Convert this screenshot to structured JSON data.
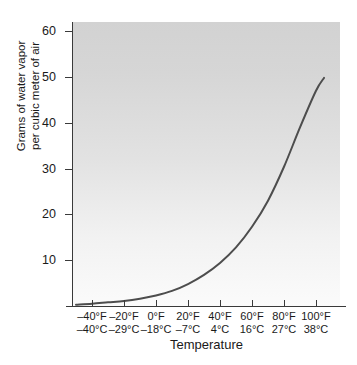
{
  "chart_data": {
    "type": "line",
    "title": "",
    "xlabel": "Temperature",
    "ylabel": "Grams of water vapor per cubic meter of air",
    "ylabel_lines": [
      "Grams of water vapor",
      "per cubic meter of air"
    ],
    "ylim": [
      0,
      63
    ],
    "yticks": [
      10,
      20,
      30,
      40,
      50,
      60
    ],
    "ytick_labels": [
      "10",
      "20",
      "30",
      "40",
      "50",
      "60"
    ],
    "xlim_f": [
      -50,
      110
    ],
    "xticks_f": [
      -40,
      -20,
      0,
      20,
      40,
      60,
      80,
      100
    ],
    "xtick_labels_f": [
      "–40°F",
      "–20°F",
      "0°F",
      "20°F",
      "40°F",
      "60°F",
      "80°F",
      "100°F"
    ],
    "xtick_labels_c": [
      "–40°C",
      "–29°C",
      "–18°C",
      "–7°C",
      "4°C",
      "16°C",
      "27°C",
      "38°C"
    ],
    "grid": false,
    "legend": null,
    "series": [
      {
        "name": "Saturation water vapor capacity",
        "color": "#4d4d4d",
        "x_f": [
          -50,
          -40,
          -30,
          -20,
          -10,
          0,
          10,
          20,
          30,
          40,
          50,
          60,
          70,
          80,
          90,
          100,
          105
        ],
        "values": [
          0.3,
          0.5,
          0.8,
          1.1,
          1.6,
          2.3,
          3.3,
          4.8,
          6.8,
          9.4,
          12.8,
          17.3,
          23.0,
          30.4,
          39.0,
          47.0,
          49.8
        ]
      }
    ]
  }
}
